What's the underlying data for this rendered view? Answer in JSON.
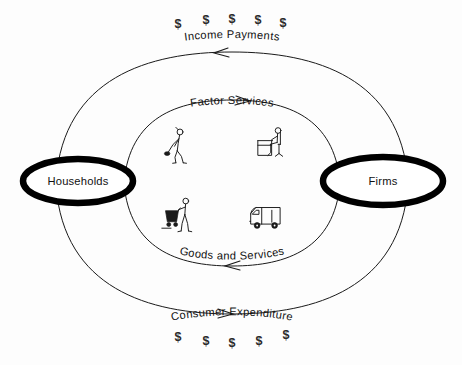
{
  "diagram": {
    "nodes": [
      {
        "id": "households",
        "label": "Households"
      },
      {
        "id": "firms",
        "label": "Firms"
      }
    ],
    "flows": [
      {
        "id": "income-payments",
        "label": "Income Payments",
        "direction": "right-to-left",
        "ring": "outer",
        "position": "top"
      },
      {
        "id": "factor-services",
        "label": "Factor Services",
        "direction": "left-to-right",
        "ring": "inner",
        "position": "top"
      },
      {
        "id": "goods-and-services",
        "label": "Goods and Services",
        "direction": "right-to-left",
        "ring": "inner",
        "position": "bottom"
      },
      {
        "id": "consumer-expenditure",
        "label": "Consumer Expenditure",
        "direction": "left-to-right",
        "ring": "outer",
        "position": "bottom"
      }
    ],
    "money_symbols": {
      "glyph": "$",
      "top_count": 5,
      "bottom_count": 5,
      "top": [
        {
          "x": 178,
          "y": 28
        },
        {
          "x": 206,
          "y": 24
        },
        {
          "x": 232,
          "y": 23
        },
        {
          "x": 258,
          "y": 24
        },
        {
          "x": 283,
          "y": 27
        }
      ],
      "bottom": [
        {
          "x": 178,
          "y": 341
        },
        {
          "x": 206,
          "y": 345
        },
        {
          "x": 232,
          "y": 347
        },
        {
          "x": 259,
          "y": 345
        },
        {
          "x": 286,
          "y": 339
        }
      ]
    },
    "illustrations": [
      {
        "id": "laborer-with-tool",
        "quadrant": "inner-top-left",
        "meaning": "labor factor service"
      },
      {
        "id": "office-worker-at-desk",
        "quadrant": "inner-top-right",
        "meaning": "firm production"
      },
      {
        "id": "shopper-with-cart",
        "quadrant": "inner-bottom-left",
        "meaning": "consumer purchasing"
      },
      {
        "id": "delivery-truck",
        "quadrant": "inner-bottom-right",
        "meaning": "goods distribution"
      }
    ],
    "colors": {
      "background": "#fdfdfd",
      "line": "#1a1a1a",
      "node_border": "#000000",
      "node_fill": "#ffffff",
      "text": "#111111"
    }
  }
}
